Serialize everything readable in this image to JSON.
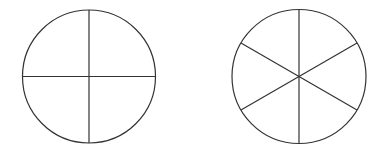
{
  "diagram": {
    "stroke_color": "#333333",
    "background": "#ffffff",
    "circles": [
      {
        "id": "circle-quarters",
        "cx": 89,
        "cy": 76.5,
        "r": 66.5,
        "divisions": 4,
        "start_angle_deg": 0
      },
      {
        "id": "circle-sixths",
        "cx": 299,
        "cy": 76.5,
        "r": 67,
        "divisions": 6,
        "start_angle_deg": 90
      }
    ]
  }
}
